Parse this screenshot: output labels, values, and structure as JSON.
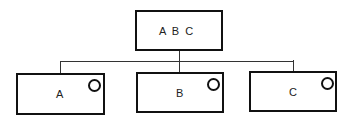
{
  "diagram": {
    "root": {
      "label": "A  B  C"
    },
    "children": [
      {
        "label": "A"
      },
      {
        "label": "B"
      },
      {
        "label": "C"
      }
    ]
  }
}
